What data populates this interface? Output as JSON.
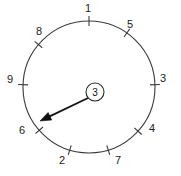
{
  "diagram": {
    "kind": "radial-dial-diagram",
    "background_color": "#ffffff",
    "line_color": "#3b3b3b",
    "pointer_color": "#111111",
    "text_color": "#1a1a1a",
    "circle": {
      "center_x": 89,
      "center_y": 87,
      "radius": 66
    },
    "center_badge": {
      "label": "3",
      "center_x": 95,
      "center_y": 92,
      "radius": 9
    },
    "pointer": {
      "from_x": 88,
      "from_y": 98,
      "to_x": 40,
      "to_y": 121,
      "points_to_label": "6"
    },
    "ticks": [
      {
        "label": "1",
        "angle_deg": 90,
        "label_x": 88,
        "label_y": 9
      },
      {
        "label": "5",
        "angle_deg": 55,
        "label_x": 130,
        "label_y": 25
      },
      {
        "label": "3",
        "angle_deg": 2,
        "label_x": 163,
        "label_y": 79
      },
      {
        "label": "4",
        "angle_deg": -42,
        "label_x": 152,
        "label_y": 129
      },
      {
        "label": "7",
        "angle_deg": -73,
        "label_x": 118,
        "label_y": 161
      },
      {
        "label": "2",
        "angle_deg": -107,
        "label_x": 62,
        "label_y": 161
      },
      {
        "label": "6",
        "angle_deg": -139,
        "label_x": 22,
        "label_y": 131
      },
      {
        "label": "9",
        "angle_deg": 178,
        "label_x": 10,
        "label_y": 80
      },
      {
        "label": "8",
        "angle_deg": 140,
        "label_x": 39,
        "label_y": 32
      }
    ]
  }
}
